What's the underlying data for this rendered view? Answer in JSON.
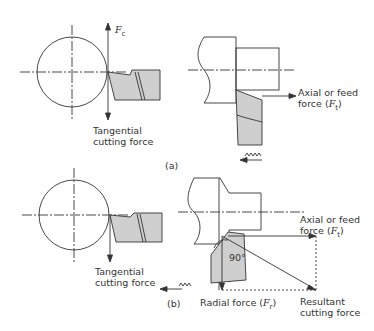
{
  "panel_a": {
    "caption": "(a)",
    "fc_label": "F",
    "fc_sub": "c",
    "tangential_line1": "Tangential",
    "tangential_line2": "cutting force",
    "axial_line1": "Axial or feed",
    "axial_line2_prefix": "force (",
    "axial_symbol": "F",
    "axial_sub": "t",
    "axial_suffix": ")"
  },
  "panel_b": {
    "caption": "(b)",
    "tangential_line1": "Tangential",
    "tangential_line2": "cutting force",
    "axial_line1": "Axial or feed",
    "axial_line2_prefix": "force (",
    "axial_symbol": "F",
    "axial_sub": "t",
    "axial_suffix": ")",
    "angle": "90°",
    "radial_prefix": "Radial force (",
    "radial_symbol": "F",
    "radial_sub": "r",
    "radial_suffix": ")",
    "resultant_line1": "Resultant",
    "resultant_line2": "cutting force"
  },
  "colors": {
    "line": "#333333",
    "tool_fill": "#cfcfcf"
  }
}
